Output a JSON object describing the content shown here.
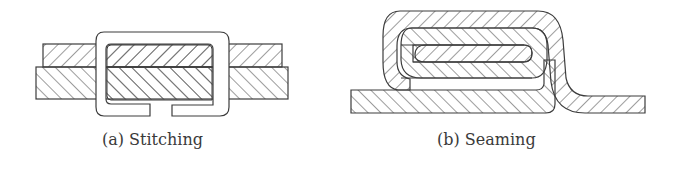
{
  "figure": {
    "panels": [
      {
        "id": "a",
        "caption": "(a) Stitching",
        "elements": [
          "upper sheet (hatched)",
          "lower sheet (hatched)",
          "wire staple (C-shaped clip)"
        ]
      },
      {
        "id": "b",
        "caption": "(b) Seaming",
        "elements": [
          "base sheet (hatched)",
          "folded/interlocked sheet layers (hatched)",
          "S-shaped return leg"
        ]
      }
    ],
    "colors": {
      "stroke": "#3c3c3c",
      "hatch": "#4a4a4a",
      "background": "#ffffff",
      "text": "#3a3a3a"
    }
  }
}
